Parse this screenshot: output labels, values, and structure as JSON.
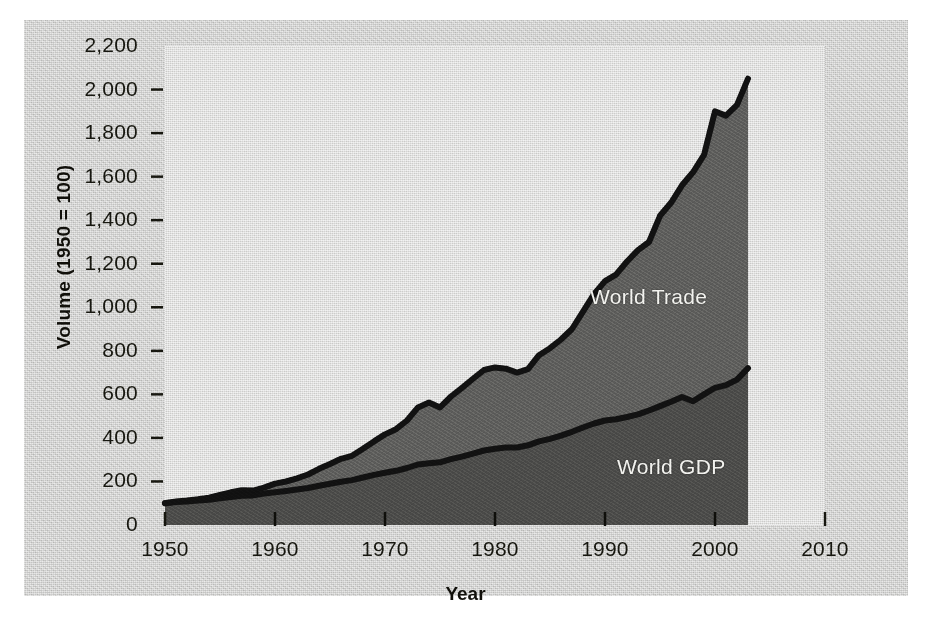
{
  "chart_data": {
    "type": "area",
    "title": "",
    "xlabel": "Year",
    "ylabel": "Volume (1950 = 100)",
    "xlim": [
      1950,
      2010
    ],
    "ylim": [
      0,
      2200
    ],
    "xticks": [
      "1950",
      "1960",
      "1970",
      "1980",
      "1990",
      "2000",
      "2010"
    ],
    "yticks": [
      "0",
      "200",
      "400",
      "600",
      "800",
      "1,000",
      "1,200",
      "1,400",
      "1,600",
      "1,800",
      "2,000",
      "2,200"
    ],
    "grid": false,
    "legend_position": "inline-annotations",
    "x": [
      1950,
      1951,
      1952,
      1953,
      1954,
      1955,
      1956,
      1957,
      1958,
      1959,
      1960,
      1961,
      1962,
      1963,
      1964,
      1965,
      1966,
      1967,
      1968,
      1969,
      1970,
      1971,
      1972,
      1973,
      1974,
      1975,
      1976,
      1977,
      1978,
      1979,
      1980,
      1981,
      1982,
      1983,
      1984,
      1985,
      1986,
      1987,
      1988,
      1989,
      1990,
      1991,
      1992,
      1993,
      1994,
      1995,
      1996,
      1997,
      1998,
      1999,
      2000,
      2001,
      2002,
      2003
    ],
    "series": [
      {
        "name": "World Trade",
        "color": "#111111",
        "fill": "#5c5c5a",
        "values": [
          100,
          108,
          112,
          118,
          126,
          138,
          150,
          160,
          158,
          172,
          190,
          200,
          214,
          232,
          258,
          280,
          304,
          318,
          350,
          384,
          416,
          440,
          480,
          540,
          562,
          540,
          590,
          630,
          672,
          712,
          724,
          718,
          700,
          716,
          780,
          812,
          852,
          900,
          980,
          1060,
          1120,
          1150,
          1210,
          1262,
          1300,
          1420,
          1480,
          1560,
          1620,
          1700,
          1900,
          1880,
          1930,
          2050
        ]
      },
      {
        "name": "World GDP",
        "color": "#111111",
        "fill": "#4a4a48",
        "values": [
          100,
          105,
          108,
          113,
          116,
          123,
          129,
          134,
          136,
          144,
          150,
          156,
          163,
          170,
          180,
          189,
          199,
          206,
          218,
          230,
          240,
          249,
          262,
          278,
          284,
          288,
          302,
          314,
          328,
          342,
          350,
          356,
          356,
          366,
          384,
          396,
          410,
          428,
          448,
          466,
          480,
          486,
          496,
          508,
          526,
          546,
          566,
          588,
          568,
          600,
          630,
          642,
          668,
          720
        ]
      }
    ],
    "annotations": [
      {
        "text": "World Trade",
        "series": "World Trade"
      },
      {
        "text": "World GDP",
        "series": "World GDP"
      }
    ]
  },
  "axes": {
    "x_title": "Year",
    "y_title": "Volume (1950 = 100)"
  },
  "colors": {
    "page_background": "#d2d2d0",
    "plot_background": "#dcdcda",
    "trade_fill": "#5c5c5a",
    "gdp_fill": "#4a4a48",
    "line": "#111111",
    "label_text": "#f2f2ee",
    "tick_text": "#16160f"
  }
}
